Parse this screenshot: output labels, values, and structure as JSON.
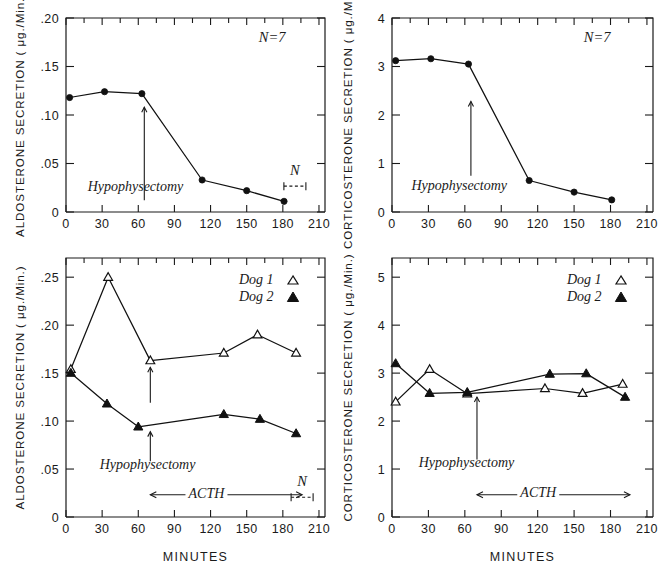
{
  "figure": {
    "xaxis_title": "MINUTES",
    "x_ticks": [
      "0",
      "30",
      "60",
      "90",
      "120",
      "150",
      "180",
      "210"
    ]
  },
  "panels": {
    "top_left": {
      "ylabel": "ALDOSTERONE SECRETION ( μg./Min.)",
      "y_ticks": [
        "0",
        ".05",
        ".10",
        ".15",
        ".20"
      ],
      "n_label": "N=7",
      "event_label": "Hypophysectomy",
      "error_label": "N"
    },
    "top_right": {
      "ylabel": "CORTICOSTERONE SECRETION ( μg./Min.)",
      "y_ticks": [
        "0",
        "1",
        "2",
        "3",
        "4"
      ],
      "n_label": "N=7",
      "event_label": "Hypophysectomy"
    },
    "bottom_left": {
      "ylabel": "ALDOSTERONE SECRETION ( μg./Min.)",
      "y_ticks": [
        "0",
        ".05",
        ".10",
        ".15",
        ".20",
        ".25"
      ],
      "event_label": "Hypophysectomy",
      "acth_label": "ACTH",
      "error_label": "N",
      "legend": [
        {
          "label": "Dog 1",
          "marker": "open-triangle"
        },
        {
          "label": "Dog 2",
          "marker": "filled-triangle"
        }
      ],
      "xaxis_title": "MINUTES"
    },
    "bottom_right": {
      "ylabel": "CORTICOSTERONE SECRETION ( μg./Min.)",
      "y_ticks": [
        "0",
        "1",
        "2",
        "3",
        "4",
        "5"
      ],
      "event_label": "Hypophysectomy",
      "acth_label": "ACTH",
      "legend": [
        {
          "label": "Dog 1",
          "marker": "open-triangle"
        },
        {
          "label": "Dog 2",
          "marker": "filled-triangle"
        }
      ],
      "xaxis_title": "MINUTES"
    }
  },
  "chart_data": [
    {
      "id": "top-left",
      "type": "line",
      "title": "",
      "xlabel": "MINUTES",
      "ylabel": "ALDOSTERONE SECRETION (μg./Min.)",
      "xlim": [
        0,
        215
      ],
      "ylim": [
        0,
        0.2
      ],
      "xticks": [
        0,
        30,
        60,
        90,
        120,
        150,
        180,
        210
      ],
      "yticks": [
        0,
        0.05,
        0.1,
        0.15,
        0.2
      ],
      "grid": false,
      "legend": "none",
      "annotations": [
        {
          "text": "N=7",
          "x": 160,
          "y": 0.175
        },
        {
          "text": "Hypophysectomy",
          "x": 18,
          "y": 0.022
        },
        {
          "text": "N",
          "x": 190,
          "y": 0.038,
          "note": "error bar key"
        }
      ],
      "event_marker": {
        "label": "Hypophysectomy",
        "x": 65,
        "type": "vertical-arrow-up",
        "y_from": 0.012,
        "y_to": 0.108
      },
      "series": [
        {
          "name": "Mean aldosterone secretion (N=7)",
          "marker": "filled-circle",
          "x": [
            3,
            32,
            63,
            113,
            150,
            181
          ],
          "values": [
            0.118,
            0.124,
            0.122,
            0.033,
            0.022,
            0.011
          ]
        }
      ]
    },
    {
      "id": "top-right",
      "type": "line",
      "title": "",
      "xlabel": "MINUTES",
      "ylabel": "CORTICOSTERONE SECRETION (μg./Min.)",
      "xlim": [
        0,
        215
      ],
      "ylim": [
        0,
        4
      ],
      "xticks": [
        0,
        30,
        60,
        90,
        120,
        150,
        180,
        210
      ],
      "yticks": [
        0,
        1,
        2,
        3,
        4
      ],
      "grid": false,
      "legend": "none",
      "annotations": [
        {
          "text": "N=7",
          "x": 158,
          "y": 3.5
        },
        {
          "text": "Hypophysectomy",
          "x": 16,
          "y": 0.45
        }
      ],
      "event_marker": {
        "label": "Hypophysectomy",
        "x": 65,
        "type": "vertical-arrow-up",
        "y_from": 0.75,
        "y_to": 2.28
      },
      "series": [
        {
          "name": "Mean corticosterone secretion (N=7)",
          "marker": "filled-circle",
          "x": [
            3,
            32,
            63,
            113,
            150,
            181
          ],
          "values": [
            3.12,
            3.16,
            3.05,
            0.65,
            0.41,
            0.25
          ]
        }
      ]
    },
    {
      "id": "bottom-left",
      "type": "line",
      "title": "",
      "xlabel": "MINUTES",
      "ylabel": "ALDOSTERONE SECRETION (μg./Min.)",
      "xlim": [
        0,
        215
      ],
      "ylim": [
        0,
        0.27
      ],
      "xticks": [
        0,
        30,
        60,
        90,
        120,
        150,
        180,
        210
      ],
      "yticks": [
        0,
        0.05,
        0.1,
        0.15,
        0.2,
        0.25
      ],
      "grid": false,
      "legend": "top-right",
      "annotations": [
        {
          "text": "Hypophysectomy",
          "x": 28,
          "y": 0.05
        },
        {
          "text": "ACTH",
          "x": 100,
          "y": 0.021
        },
        {
          "text": "N",
          "x": 196,
          "y": 0.032,
          "note": "error bar key"
        }
      ],
      "event_marker": {
        "label": "Hypophysectomy",
        "x": 70,
        "type": "vertical-arrow-up-double"
      },
      "acth_span": {
        "label": "ACTH",
        "x_from": 70,
        "x_to": 196
      },
      "series": [
        {
          "name": "Dog 1",
          "marker": "open-triangle",
          "x": [
            4,
            35,
            70,
            131,
            159,
            191
          ],
          "values": [
            0.154,
            0.25,
            0.163,
            0.171,
            0.19,
            0.171
          ]
        },
        {
          "name": "Dog 2",
          "marker": "filled-triangle",
          "x": [
            4,
            34,
            60,
            131,
            161,
            191
          ],
          "values": [
            0.15,
            0.118,
            0.094,
            0.107,
            0.102,
            0.087
          ]
        }
      ]
    },
    {
      "id": "bottom-right",
      "type": "line",
      "title": "",
      "xlabel": "MINUTES",
      "ylabel": "CORTICOSTERONE SECRETION (μg./Min.)",
      "xlim": [
        0,
        215
      ],
      "ylim": [
        0,
        5.4
      ],
      "xticks": [
        0,
        30,
        60,
        90,
        120,
        150,
        180,
        210
      ],
      "yticks": [
        0,
        1,
        2,
        3,
        4,
        5
      ],
      "grid": false,
      "legend": "top-right",
      "annotations": [
        {
          "text": "Hypophysectomy",
          "x": 22,
          "y": 1.05
        },
        {
          "text": "ACTH",
          "x": 104,
          "y": 0.44
        }
      ],
      "event_marker": {
        "label": "Hypophysectomy",
        "x": 70,
        "type": "vertical-arrow-up",
        "y_from": 1.2,
        "y_to": 2.5
      },
      "acth_span": {
        "label": "ACTH",
        "x_from": 70,
        "x_to": 196
      },
      "series": [
        {
          "name": "Dog 1",
          "marker": "open-triangle",
          "x": [
            3,
            31,
            62,
            126,
            157,
            190
          ],
          "values": [
            2.4,
            3.08,
            2.57,
            2.68,
            2.58,
            2.77
          ]
        },
        {
          "name": "Dog 2",
          "marker": "filled-triangle",
          "x": [
            3,
            31,
            62,
            130,
            160,
            192
          ],
          "values": [
            3.2,
            2.58,
            2.6,
            2.98,
            2.99,
            2.5
          ]
        }
      ]
    }
  ]
}
